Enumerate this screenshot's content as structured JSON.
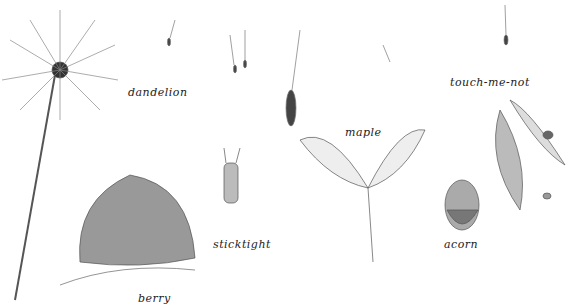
{
  "illustration": {
    "subject": "seed types pencil drawing",
    "labels": [
      {
        "text": "dandelion",
        "x": 128,
        "y": 86
      },
      {
        "text": "maple",
        "x": 345,
        "y": 126
      },
      {
        "text": "touch-me-not",
        "x": 450,
        "y": 76
      },
      {
        "text": "sticktight",
        "x": 213,
        "y": 238
      },
      {
        "text": "acorn",
        "x": 444,
        "y": 238
      },
      {
        "text": "berry",
        "x": 138,
        "y": 292
      }
    ]
  }
}
